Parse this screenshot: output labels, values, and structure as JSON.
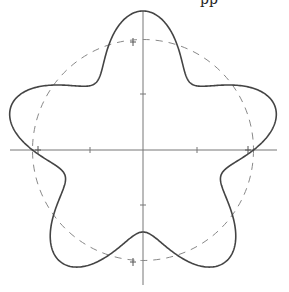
{
  "figure": {
    "type": "polar-curve",
    "center": [
      143,
      150
    ],
    "curve": {
      "a": 110.5,
      "b": 28.5,
      "k": 5,
      "phase_deg": 90,
      "stroke": "#444444"
    },
    "reference_circle": {
      "radius": 110.5,
      "stroke": "#888888",
      "dash": "7,6"
    },
    "axes": {
      "horizontal": {
        "x1": 10,
        "x2": 277,
        "y": 150
      },
      "vertical": {
        "x": 143,
        "y1": 11,
        "y2": 285
      },
      "stroke": "#777777",
      "ticks": [
        {
          "x": 90,
          "y": 150,
          "dir": "v"
        },
        {
          "x": 197,
          "y": 150,
          "dir": "v"
        },
        {
          "x": 143,
          "y": 94,
          "dir": "h"
        },
        {
          "x": 143,
          "y": 205,
          "dir": "h"
        }
      ]
    },
    "markers": [
      {
        "x": 133,
        "y": 42
      },
      {
        "x": 133,
        "y": 262
      },
      {
        "x": 38,
        "y": 150
      },
      {
        "x": 248,
        "y": 150
      }
    ]
  },
  "cut_text": "pp"
}
